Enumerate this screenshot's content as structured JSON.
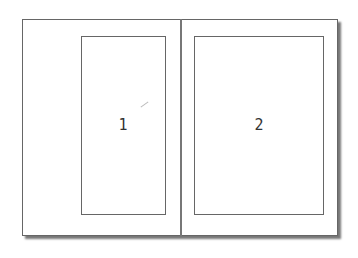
{
  "diagram": {
    "type": "page-spread-layout",
    "panels": [
      {
        "label": "1"
      },
      {
        "label": "2"
      }
    ],
    "colors": {
      "border": "#666666",
      "shadow": "#777777",
      "background": "#ffffff"
    }
  }
}
